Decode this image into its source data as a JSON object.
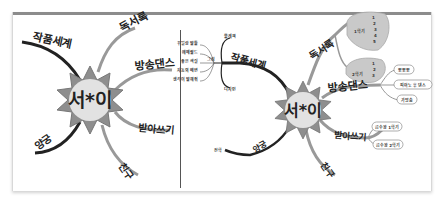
{
  "left_map": {
    "center": "서*이",
    "branches": [
      {
        "label": "작품세계"
      },
      {
        "label": "독서록"
      },
      {
        "label": "방송댄스"
      },
      {
        "label": "받아쓰기"
      },
      {
        "label": "친구"
      },
      {
        "label": "양궁"
      }
    ]
  },
  "right_map": {
    "center": "서*이",
    "branches": {
      "works": {
        "label": "작품세계",
        "children": [
          "물레책",
          "그림",
          "디자인"
        ],
        "drawing_children": [
          "꾸밀랑 말들",
          "에메랄드",
          "좋은 색칠",
          "자동의 배변",
          "생각이 말해줘"
        ]
      },
      "reading": {
        "label": "독서록",
        "children": [
          "1학기",
          "2학기"
        ],
        "semester1_items": [
          "1",
          "2",
          "3",
          "4",
          "5"
        ],
        "semester2_items": [
          "1",
          "2",
          "3"
        ]
      },
      "dance": {
        "label": "방송댄스",
        "children": [
          "뽀뽀뽀",
          "피아노 후 댄스",
          "가방춤"
        ]
      },
      "dictation": {
        "label": "받아쓰기",
        "children": [
          "급수왕 1학기",
          "급수왕 2학기"
        ]
      },
      "friend": {
        "label": "친구"
      },
      "archery": {
        "label": "양궁",
        "children": [
          "전학"
        ]
      }
    }
  }
}
